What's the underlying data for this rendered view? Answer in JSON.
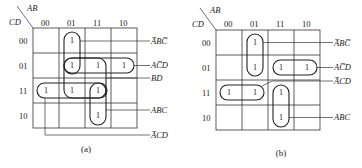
{
  "diagrams": [
    {
      "id": "a",
      "caption": "(a)",
      "row_var": "CD",
      "col_var": "AB",
      "col_headers": [
        "00",
        "01",
        "11",
        "10"
      ],
      "row_headers": [
        "00",
        "01",
        "11",
        "10"
      ],
      "cells": [
        [
          "",
          "1",
          "",
          ""
        ],
        [
          "",
          "1",
          "1",
          "1"
        ],
        [
          "1",
          "1",
          "1",
          ""
        ],
        [
          "",
          "",
          "1",
          ""
        ]
      ],
      "terms": [
        "A̅BC̅",
        "AC̅D",
        "BD",
        "ABC",
        "A̅CD"
      ]
    },
    {
      "id": "b",
      "caption": "(b)",
      "row_var": "CD",
      "col_var": "AB",
      "col_headers": [
        "00",
        "01",
        "11",
        "10"
      ],
      "row_headers": [
        "00",
        "01",
        "11",
        "10"
      ],
      "cells": [
        [
          "",
          "1",
          "",
          ""
        ],
        [
          "",
          "1",
          "1",
          "1"
        ],
        [
          "1",
          "1",
          "1",
          ""
        ],
        [
          "",
          "",
          "1",
          ""
        ]
      ],
      "terms": [
        "A̅BC̅",
        "AC̅D",
        "A̅CD",
        "ABC"
      ]
    }
  ]
}
